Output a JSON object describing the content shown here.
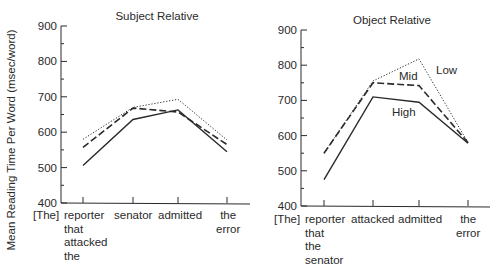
{
  "chart_data": [
    {
      "type": "line",
      "title": "Subject Relative",
      "xlabel": "",
      "ylabel": "Mean Reading Time Per Word (msec/word)",
      "categories": [
        "[The]",
        "reporter that attacked the",
        "senator",
        "admitted",
        "the error"
      ],
      "plotted_categories": [
        "reporter that attacked the",
        "senator",
        "admitted",
        "the error"
      ],
      "ylim": [
        400,
        900
      ],
      "yticks": [
        400,
        500,
        600,
        700,
        800,
        900
      ],
      "grid": false,
      "legend": "none (series not labeled in this panel)",
      "series": [
        {
          "name": "Low",
          "style": "dotted",
          "values": [
            580,
            670,
            693,
            578
          ]
        },
        {
          "name": "Mid",
          "style": "dashed",
          "values": [
            557,
            668,
            657,
            565
          ]
        },
        {
          "name": "High",
          "style": "solid",
          "values": [
            506,
            636,
            663,
            545
          ]
        }
      ]
    },
    {
      "type": "line",
      "title": "Object Relative",
      "xlabel": "",
      "ylabel": "",
      "categories": [
        "[The]",
        "reporter that the senator",
        "attacked",
        "admitted",
        "the error"
      ],
      "plotted_categories": [
        "reporter that the senator",
        "attacked",
        "admitted",
        "the error"
      ],
      "ylim": [
        400,
        900
      ],
      "yticks": [
        400,
        500,
        600,
        700,
        800,
        900
      ],
      "grid": false,
      "legend": "inline labels",
      "annotations": [
        "Low",
        "Mid",
        "High"
      ],
      "series": [
        {
          "name": "Low",
          "style": "dotted",
          "values": [
            550,
            755,
            818,
            580
          ]
        },
        {
          "name": "Mid",
          "style": "dashed",
          "values": [
            550,
            750,
            742,
            580
          ]
        },
        {
          "name": "High",
          "style": "solid",
          "values": [
            475,
            710,
            695,
            578
          ]
        }
      ]
    }
  ],
  "figure": {
    "ylabel": "Mean Reading Time Per Word (msec/word)",
    "panels": [
      {
        "title": "Subject Relative",
        "x_labels": [
          "[The]",
          "reporter\nthat\nattacked\nthe",
          "senator",
          "admitted",
          "the\nerror"
        ]
      },
      {
        "title": "Object Relative",
        "x_labels": [
          "[The]",
          "reporter\nthat\nthe\nsenator",
          "attacked",
          "admitted",
          "the\nerror"
        ],
        "inline_labels": {
          "low": "Low",
          "mid": "Mid",
          "high": "High"
        }
      }
    ]
  }
}
